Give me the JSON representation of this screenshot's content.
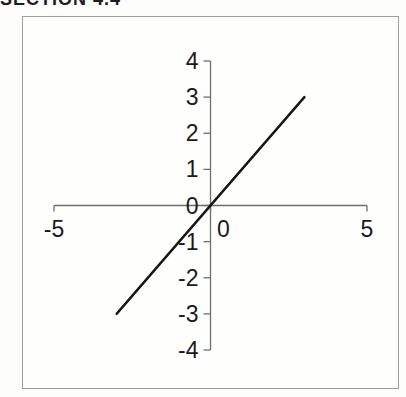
{
  "page": {
    "cropped_header_text": "SECTION 4.4"
  },
  "chart_data": {
    "type": "line",
    "title": "",
    "xlabel": "",
    "ylabel": "",
    "xlim": [
      -5,
      5
    ],
    "ylim": [
      -4,
      4
    ],
    "x_ticks": [
      -5,
      0,
      5
    ],
    "y_ticks": [
      4,
      3,
      2,
      1,
      0,
      -1,
      -2,
      -3,
      -4
    ],
    "grid": false,
    "legend": "none",
    "series": [
      {
        "name": "",
        "points": [
          [
            -3,
            -3
          ],
          [
            3,
            3
          ]
        ]
      }
    ],
    "colors": {
      "line": "#161616",
      "axis": "#6e6e6e",
      "label": "#1a1a1a",
      "box_border": "#9e9e9e"
    }
  }
}
